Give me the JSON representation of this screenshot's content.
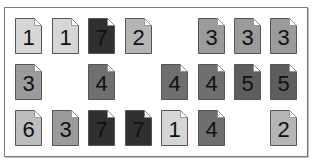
{
  "board": {
    "colors": {
      "1": "#d6d6d6",
      "2": "#b5b5b5",
      "3": "#9b9b9b",
      "4": "#6f6f6f",
      "5": "#5e5e5e",
      "6": "#bdbdbd",
      "7": "#303030"
    },
    "rows": [
      [
        "1",
        "1",
        "7",
        "2",
        "",
        "3",
        "3",
        "3"
      ],
      [
        "3",
        "",
        "4",
        "",
        "4",
        "4",
        "5",
        "5"
      ],
      [
        "6",
        "3",
        "7",
        "7",
        "1",
        "4",
        "",
        "2"
      ]
    ]
  }
}
